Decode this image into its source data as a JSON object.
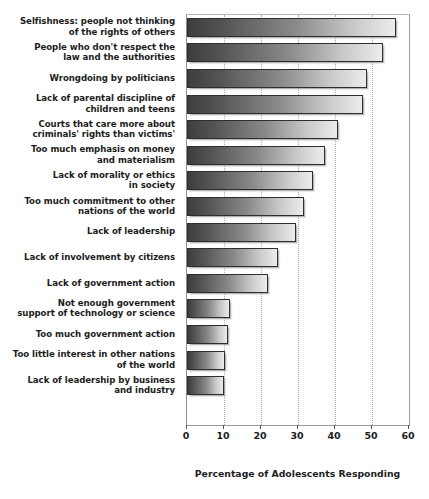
{
  "chart_data": {
    "type": "bar",
    "orientation": "horizontal",
    "title": "",
    "xlabel": "Percentage of Adolescents Responding",
    "ylabel": "",
    "xlim": [
      0,
      60
    ],
    "xticks": [
      0,
      10,
      20,
      30,
      40,
      50,
      60
    ],
    "xtick_labels": [
      "0",
      "10",
      "20",
      "30",
      "40",
      "50",
      "60"
    ],
    "grid": true,
    "grid_axis": "x",
    "legend": false,
    "categories": [
      "Selfishness: people not thinking of the rights of others",
      "People who don't respect the law and the authorities",
      "Wrongdoing by politicians",
      "Lack of parental discipline of children and teens",
      "Courts that care more about criminals' rights than victims'",
      "Too much emphasis on money and materialism",
      "Lack of morality or ethics in society",
      "Too much commitment to other nations of the world",
      "Lack of leadership",
      "Lack of involvement by citizens",
      "Lack of government action",
      "Not enough government support of technology or science",
      "Too much government action",
      "Too little interest in other nations of the world",
      "Lack of leadership by business and industry"
    ],
    "values": [
      56.5,
      53,
      48.7,
      47.5,
      40.8,
      37.4,
      34,
      31.7,
      29.5,
      24.5,
      22,
      11.7,
      11,
      10.3,
      10
    ],
    "bar_gradient_start": "#3d3d3d",
    "bar_gradient_end": "#ececec",
    "bar_border_color": "#2e2e2e",
    "background_color": "#ffffff"
  },
  "labels": [
    {
      "lines": [
        "Selfishness: people not thinking",
        "of the rights of others"
      ]
    },
    {
      "lines": [
        "People who don't respect the",
        "law and the authorities"
      ]
    },
    {
      "lines": [
        "Wrongdoing by politicians"
      ]
    },
    {
      "lines": [
        "Lack of parental discipline of",
        "children and teens"
      ]
    },
    {
      "lines": [
        "Courts that care more about",
        "criminals' rights than victims'"
      ]
    },
    {
      "lines": [
        "Too much emphasis on money",
        "and materialism"
      ]
    },
    {
      "lines": [
        "Lack of morality or ethics",
        "in society"
      ]
    },
    {
      "lines": [
        "Too much commitment to other",
        "nations of the world"
      ]
    },
    {
      "lines": [
        "Lack of leadership"
      ]
    },
    {
      "lines": [
        "Lack of involvement by citizens"
      ]
    },
    {
      "lines": [
        "Lack of government action"
      ]
    },
    {
      "lines": [
        "Not enough government",
        "support of technology or science"
      ]
    },
    {
      "lines": [
        "Too much government action"
      ]
    },
    {
      "lines": [
        "Too little interest in other nations",
        "of the world"
      ]
    },
    {
      "lines": [
        "Lack of leadership by business",
        "and industry"
      ]
    }
  ]
}
